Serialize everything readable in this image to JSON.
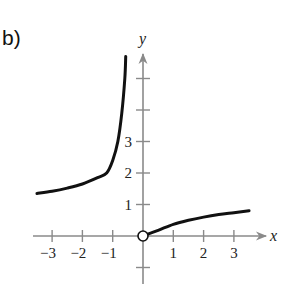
{
  "part_label": "b)",
  "chart_data": {
    "type": "line",
    "title": "",
    "xlabel": "x",
    "ylabel": "y",
    "xlim": [
      -3.5,
      3.9
    ],
    "ylim": [
      -1.5,
      6.2
    ],
    "grid": false,
    "x_ticks": [
      -3,
      -2,
      -1,
      1,
      2,
      3
    ],
    "x_tick_labels": [
      "−3",
      "−2",
      "−1",
      "1",
      "2",
      "3"
    ],
    "y_ticks": [
      -1,
      1,
      2,
      3,
      4,
      5
    ],
    "y_tick_labels": [
      "",
      "1",
      "2",
      "3",
      "",
      ""
    ],
    "series": [
      {
        "name": "left branch",
        "x": [
          -3.5,
          -3.0,
          -2.5,
          -2.0,
          -1.5,
          -1.2,
          -1.0,
          -0.83,
          -0.7,
          -0.6,
          -0.57
        ],
        "y": [
          1.35,
          1.42,
          1.52,
          1.65,
          1.85,
          2.0,
          2.4,
          3.0,
          3.9,
          5.0,
          5.7
        ]
      },
      {
        "name": "right branch",
        "x": [
          0,
          0.5,
          1.0,
          1.5,
          2.0,
          2.5,
          3.0,
          3.5
        ],
        "y": [
          0,
          0.18,
          0.37,
          0.5,
          0.6,
          0.68,
          0.74,
          0.8
        ]
      }
    ],
    "annotations": [
      {
        "type": "open-circle",
        "x": 0,
        "y": 0
      }
    ]
  }
}
